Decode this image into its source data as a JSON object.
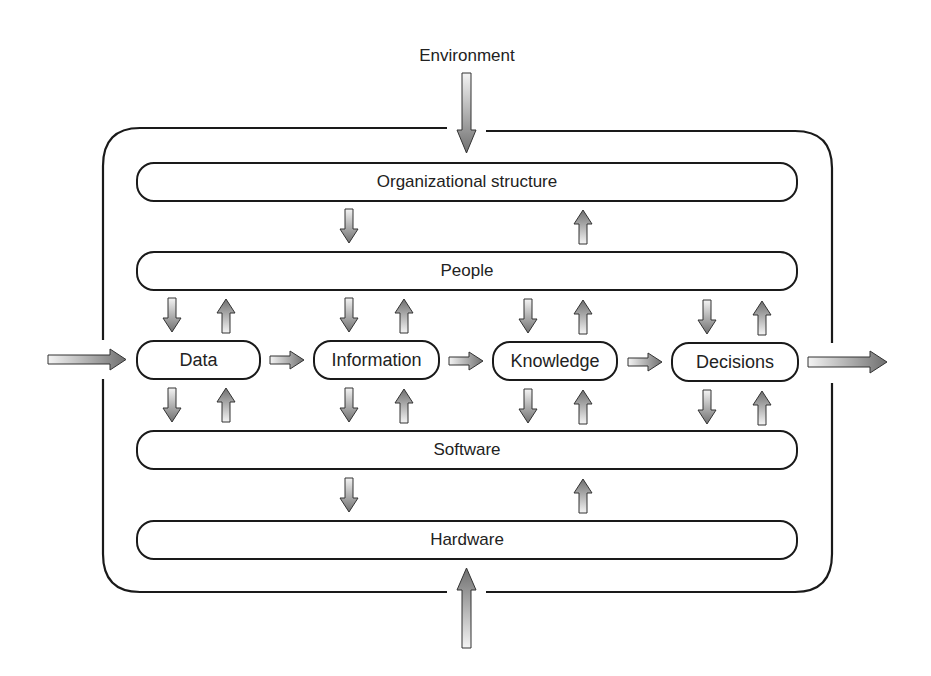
{
  "diagram": {
    "environment_label": "Environment",
    "layers": [
      {
        "id": "org",
        "label": "Organizational structure"
      },
      {
        "id": "people",
        "label": "People"
      },
      {
        "id": "software",
        "label": "Software"
      },
      {
        "id": "hardware",
        "label": "Hardware"
      }
    ],
    "flow_nodes": [
      {
        "id": "data",
        "label": "Data"
      },
      {
        "id": "information",
        "label": "Information"
      },
      {
        "id": "knowledge",
        "label": "Knowledge"
      },
      {
        "id": "decisions",
        "label": "Decisions"
      }
    ],
    "edges": [
      {
        "from": "Environment",
        "to": "Organizational structure",
        "direction": "down"
      },
      {
        "from": "Environment (below)",
        "to": "Hardware",
        "direction": "up"
      },
      {
        "from": "External input",
        "to": "Data",
        "direction": "right"
      },
      {
        "from": "Data",
        "to": "Information",
        "direction": "right"
      },
      {
        "from": "Information",
        "to": "Knowledge",
        "direction": "right"
      },
      {
        "from": "Knowledge",
        "to": "Decisions",
        "direction": "right"
      },
      {
        "from": "Decisions",
        "to": "External output",
        "direction": "right"
      },
      {
        "from": "Organizational structure",
        "to": "People",
        "direction": "down"
      },
      {
        "from": "People",
        "to": "Organizational structure",
        "direction": "up"
      },
      {
        "from": "People",
        "to": "Data/Information/Knowledge/Decisions",
        "direction": "down"
      },
      {
        "from": "Data/Information/Knowledge/Decisions",
        "to": "People",
        "direction": "up"
      },
      {
        "from": "Data/Information/Knowledge/Decisions",
        "to": "Software",
        "direction": "down"
      },
      {
        "from": "Software",
        "to": "Data/Information/Knowledge/Decisions",
        "direction": "up"
      },
      {
        "from": "Software",
        "to": "Hardware",
        "direction": "down"
      },
      {
        "from": "Hardware",
        "to": "Software",
        "direction": "up"
      }
    ],
    "colors": {
      "stroke": "#1a1a1a",
      "arrow_light": "#f2f2f2",
      "arrow_dark": "#7a7a7a",
      "background": "#ffffff"
    }
  }
}
